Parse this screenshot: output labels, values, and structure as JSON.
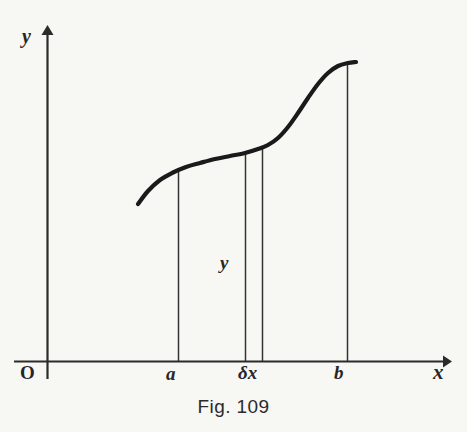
{
  "figure": {
    "caption": "Fig. 109",
    "background_color": "#f7f7f4",
    "ink_color": "#1a1a1a"
  },
  "labels": {
    "y_axis": "y",
    "x_axis": "x",
    "origin": "O",
    "a": "a",
    "b": "b",
    "delta_x": "δx",
    "ordinate_y": "y"
  },
  "chart_data": {
    "type": "line",
    "title": "Fig. 109",
    "xlabel": "x",
    "ylabel": "y",
    "grid": false,
    "legend": null,
    "axes": {
      "origin_label": "O",
      "x_axis_arrow": true,
      "y_axis_arrow": true,
      "x_tick_labels": [
        "a",
        "δx",
        "b"
      ],
      "y_tick_labels": []
    },
    "curve_points": [
      [
        138,
        204
      ],
      [
        148,
        191
      ],
      [
        160,
        180
      ],
      [
        172,
        173
      ],
      [
        186,
        167
      ],
      [
        200,
        163
      ],
      [
        215,
        159
      ],
      [
        230,
        156
      ],
      [
        245,
        153
      ],
      [
        258,
        149
      ],
      [
        268,
        145
      ],
      [
        278,
        138
      ],
      [
        288,
        127
      ],
      [
        298,
        113
      ],
      [
        308,
        98
      ],
      [
        318,
        84
      ],
      [
        328,
        73
      ],
      [
        338,
        66
      ],
      [
        348,
        63
      ],
      [
        356,
        62
      ]
    ],
    "vertical_lines": [
      {
        "name": "a",
        "x": 178,
        "y_top": 171,
        "y_bottom": 361,
        "label": "a"
      },
      {
        "name": "strip-left",
        "x": 245,
        "y_top": 153,
        "y_bottom": 361,
        "label": "y"
      },
      {
        "name": "strip-right",
        "x": 262,
        "y_top": 148,
        "y_bottom": 361,
        "label": ""
      },
      {
        "name": "b",
        "x": 347,
        "y_top": 64,
        "y_bottom": 361,
        "label": "b"
      }
    ],
    "annotations": [
      {
        "text": "δx",
        "x": 250,
        "y": 374,
        "meaning": "width of the elementary strip"
      },
      {
        "text": "y",
        "x": 226,
        "y": 265,
        "meaning": "ordinate of the strip"
      }
    ],
    "xlim": [
      14,
      450
    ],
    "ylim": [
      378,
      28
    ]
  }
}
